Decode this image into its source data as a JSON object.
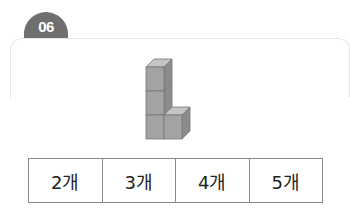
{
  "problem": {
    "number": "06",
    "badge_color": "#6f6f6f",
    "figure": {
      "description": "L-shaped stack of unit cubes: 3 cubes stacked vertically with 1 cube to the right of the bottom cube",
      "cube_count": 4,
      "cube_colors": {
        "front": "#a3a3a3",
        "top": "#c4c4c4",
        "side": "#8c8c8c"
      }
    },
    "choices": [
      {
        "label": "2개"
      },
      {
        "label": "3개"
      },
      {
        "label": "4개"
      },
      {
        "label": "5개"
      }
    ]
  }
}
